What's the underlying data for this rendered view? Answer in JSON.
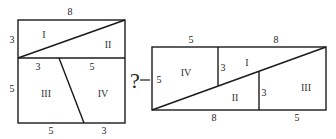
{
  "left_square": {
    "top_label": "8",
    "left_top_label": "3",
    "left_bottom_label": "5",
    "mid_left_label": "3",
    "mid_right_label": "5",
    "bottom_left_label": "5",
    "bottom_right_label": "3",
    "regions": [
      "I",
      "II",
      "III",
      "IV"
    ]
  },
  "connector": {
    "symbol": "?"
  },
  "right_rectangle": {
    "top_left_label": "5",
    "top_right_label": "8",
    "left_label": "5",
    "inner_vertical_1_label": "3",
    "inner_vertical_2_label": "3",
    "bottom_left_label": "8",
    "bottom_right_label": "5",
    "regions": [
      "IV",
      "I",
      "II",
      "III"
    ]
  }
}
